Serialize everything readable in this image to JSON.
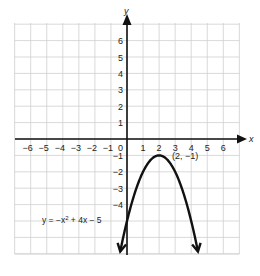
{
  "chart_data": {
    "type": "line",
    "title": "",
    "xlabel": "x",
    "ylabel": "y",
    "xlim": [
      -7,
      7
    ],
    "ylim": [
      -7,
      7
    ],
    "grid": true,
    "x_ticks": [
      -6,
      -5,
      -4,
      -3,
      -2,
      -1,
      0,
      1,
      2,
      3,
      4,
      5,
      6
    ],
    "y_ticks": [
      6,
      5,
      4,
      3,
      2,
      1,
      -1,
      -2,
      -3,
      -4
    ],
    "x_tick_labels": [
      "−6",
      "−5",
      "−4",
      "−3",
      "−2",
      "−1",
      "0",
      "1",
      "2",
      "3",
      "4",
      "5",
      "6"
    ],
    "y_tick_labels": [
      "6",
      "5",
      "4",
      "3",
      "2",
      "1",
      "−1",
      "−2",
      "−3",
      "−4"
    ],
    "series": [
      {
        "name": "y = −x² + 4x − 5",
        "equation": "y = -x^2 + 4x - 5",
        "x": [
          -0.45,
          0,
          0.5,
          1,
          1.5,
          2,
          2.5,
          3,
          3.5,
          4,
          4.45
        ],
        "y": [
          -7,
          -5,
          -3.25,
          -2,
          -1.25,
          -1,
          -1.25,
          -2,
          -3.25,
          -5,
          -7
        ],
        "arrows_at_ends": true
      }
    ],
    "annotations": [
      {
        "text": "(2, −1)",
        "x": 2,
        "y": -1,
        "role": "vertex"
      },
      {
        "text": "y = −x² + 4x − 5",
        "role": "equation-label"
      }
    ]
  },
  "labels": {
    "x_axis": "x",
    "y_axis": "y",
    "vertex": "(2, −1)",
    "equation_prefix": "y = −x",
    "equation_exp": "2",
    "equation_suffix": " + 4x − 5"
  },
  "colors": {
    "grid": "#cfcfcf",
    "axis": "#111111",
    "curve": "#111111",
    "text": "#222222"
  }
}
